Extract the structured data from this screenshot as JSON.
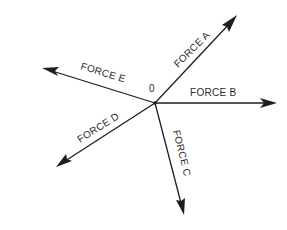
{
  "diagram": {
    "type": "concurrent-force-vectors",
    "origin": {
      "label": "0",
      "x": 155,
      "y": 103
    },
    "colors": {
      "line": "#1e1e1e",
      "text": "#2a2a2a",
      "background": "#ffffff"
    },
    "forces": [
      {
        "id": "A",
        "label": "FORCE A",
        "tip": {
          "x": 237,
          "y": 15
        }
      },
      {
        "id": "B",
        "label": "FORCE B",
        "tip": {
          "x": 277,
          "y": 103
        }
      },
      {
        "id": "C",
        "label": "FORCE C",
        "tip": {
          "x": 184,
          "y": 215
        }
      },
      {
        "id": "D",
        "label": "FORCE D",
        "tip": {
          "x": 56,
          "y": 167
        }
      },
      {
        "id": "E",
        "label": "FORCE E",
        "tip": {
          "x": 42,
          "y": 68
        }
      }
    ]
  }
}
